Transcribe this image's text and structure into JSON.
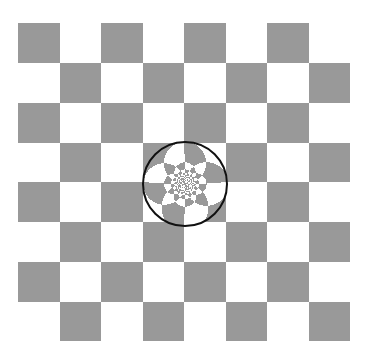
{
  "image": {
    "width": 367,
    "height": 360,
    "background": "#ffffff"
  },
  "board": {
    "rows": 8,
    "cols": 8,
    "x": 18,
    "y": 23,
    "width": 332,
    "height": 318,
    "dark_color": "#999999",
    "light_color": "#ffffff",
    "border_color": "#c8c8c8",
    "top_left_is_dark": true
  },
  "circle": {
    "cx": 185,
    "cy": 184,
    "r": 42,
    "stroke_color": "#111111",
    "stroke_width": 2,
    "content": "circle-inversion of checkerboard"
  }
}
